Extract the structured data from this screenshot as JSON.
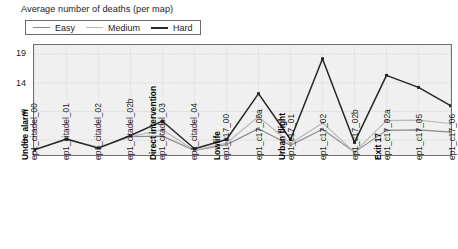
{
  "chart_data": {
    "type": "line",
    "title": "Average number of deaths (per map)",
    "xlabel": "",
    "ylabel": "",
    "ylim": [
      1.4,
      20.6
    ],
    "yticks": [
      4,
      9,
      14,
      19
    ],
    "grid": true,
    "legend_position": "top-left",
    "categories": [
      "ep1_citadel_00",
      "ep1_citadel_01",
      "ep1_citadel_02",
      "ep1_citadel_02b",
      "ep1_citadel_03",
      "ep1_citadel_04",
      "ep1_c17_00",
      "ep1_c17_00a",
      "ep1_c17_01",
      "ep1_c17_02",
      "ep1_c17_02b",
      "ep1_c17_02a",
      "ep1_c17_05",
      "ep1_c17_06"
    ],
    "category_headers": [
      "Undue alarm",
      "",
      "",
      "",
      "Direct intervention",
      "",
      "Lowlife",
      "",
      "Urban flight",
      "",
      "",
      "Exit 17",
      "",
      ""
    ],
    "series": [
      {
        "name": "Easy",
        "color": "#8a8a8a",
        "values": [
          2.4,
          4.1,
          2.7,
          4.6,
          4.7,
          2.2,
          3.2,
          6.0,
          3.1,
          5.9,
          1.9,
          5.7,
          5.8,
          5.4
        ]
      },
      {
        "name": "Medium",
        "color": "#b8b8b8",
        "values": [
          2.4,
          4.1,
          2.8,
          4.6,
          5.8,
          2.2,
          3.5,
          8.1,
          3.4,
          7.0,
          1.9,
          7.4,
          7.5,
          6.9
        ]
      },
      {
        "name": "Hard",
        "color": "#262626",
        "values": [
          2.3,
          4.2,
          2.6,
          4.8,
          7.3,
          2.5,
          4.1,
          12.1,
          4.1,
          18.2,
          3.6,
          15.3,
          13.2,
          10.0
        ]
      }
    ]
  }
}
